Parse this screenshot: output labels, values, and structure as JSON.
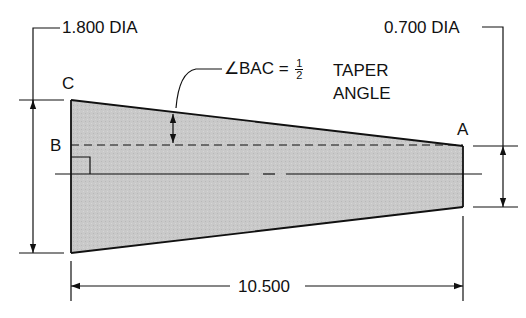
{
  "diagram": {
    "type": "engineering-drawing",
    "dimensions": {
      "large_diameter": "1.800 DIA",
      "small_diameter": "0.700 DIA",
      "length": "10.500"
    },
    "points": {
      "a": "A",
      "b": "B",
      "c": "C"
    },
    "annotation": {
      "angle_label": "∠BAC =",
      "fraction_num": "1",
      "fraction_den": "2",
      "line1": "TAPER",
      "line2": "ANGLE"
    },
    "colors": {
      "fill": "#c8c8c8",
      "stroke": "#111111",
      "background": "#ffffff"
    }
  }
}
